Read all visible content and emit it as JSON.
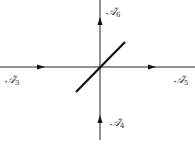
{
  "diagram": {
    "stroke_color": "#222222",
    "labels": {
      "left": {
        "base": "𝒜̂",
        "sub": "3"
      },
      "right": {
        "base": "𝒜̂",
        "sub": "5"
      },
      "top": {
        "base": "𝒜̂",
        "sub": "6"
      },
      "bottom": {
        "base": "𝒜̂",
        "sub": "4"
      }
    },
    "lines": [
      {
        "name": "horizontal-line",
        "x1": 0,
        "y1": 67,
        "x2": 195,
        "y2": 67
      },
      {
        "name": "vertical-line",
        "x1": 100,
        "y1": 0,
        "x2": 100,
        "y2": 140
      },
      {
        "name": "diagonal-line",
        "x1": 76,
        "y1": 92,
        "x2": 125,
        "y2": 42
      }
    ],
    "arrows": [
      {
        "name": "arrow-left-segment",
        "x": 42,
        "y": 67,
        "direction": "right"
      },
      {
        "name": "arrow-right-segment",
        "x": 153,
        "y": 67,
        "direction": "right"
      },
      {
        "name": "arrow-top-segment",
        "x": 100,
        "y": 21,
        "direction": "up"
      },
      {
        "name": "arrow-bottom-segment",
        "x": 100,
        "y": 119,
        "direction": "up"
      }
    ]
  }
}
